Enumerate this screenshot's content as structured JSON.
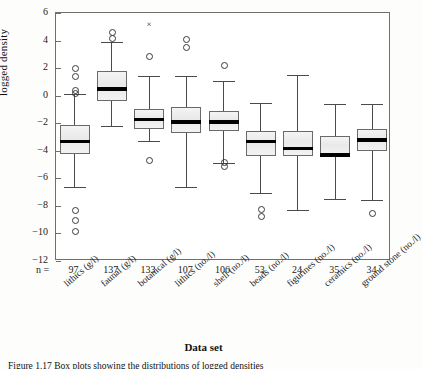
{
  "figure": {
    "caption_prefix": "Figure",
    "caption_text": "Figure  1.17 Box plots showing the distributions of logged densities"
  },
  "axes": {
    "ylabel": "logged density",
    "xlabel": "Data set",
    "n_prefix": "n =",
    "yticks": [
      6,
      4,
      2,
      0,
      -2,
      -4,
      -6,
      -8,
      -10,
      -12
    ],
    "ytick_labels": [
      "6",
      "4",
      "2",
      "0",
      "−2",
      "−4",
      "−6",
      "−8",
      "−10",
      "−12"
    ],
    "ylim": [
      -12,
      6
    ],
    "grid": false
  },
  "chart_data": {
    "type": "box",
    "title": "",
    "xlabel": "Data set",
    "ylabel": "logged density",
    "ylim": [
      -12,
      6
    ],
    "grid": false,
    "legend": "none",
    "categories": [
      "lithics (g/l)",
      "faunal (g/l)",
      "botanical (g/l)",
      "lithics (no./l)",
      "shell (no./l)",
      "beads (no./l)",
      "figurines (no./l)",
      "ceramics (no./l)",
      "ground stone (no./l)"
    ],
    "n": [
      97,
      137,
      133,
      107,
      106,
      53,
      24,
      35,
      34
    ],
    "boxes": [
      {
        "category": "lithics (g/l)",
        "n": 97,
        "whisker_low": -6.6,
        "q1": -4.2,
        "median": -3.3,
        "q3": -2.1,
        "whisker_high": 0.1,
        "outliers": [
          2.0,
          1.4,
          0.4,
          0.2,
          -8.3,
          -9.0,
          -9.8
        ],
        "extreme_outliers": []
      },
      {
        "category": "faunal (g/l)",
        "n": 137,
        "whisker_low": -2.2,
        "q1": -0.4,
        "median": 0.5,
        "q3": 1.8,
        "whisker_high": 3.9,
        "outliers": [
          4.6,
          4.2
        ],
        "extreme_outliers": []
      },
      {
        "category": "botanical (g/l)",
        "n": 133,
        "whisker_low": -3.3,
        "q1": -2.4,
        "median": -1.7,
        "q3": -1.0,
        "whisker_high": 1.4,
        "outliers": [
          2.9,
          -4.7
        ],
        "extreme_outliers": [
          5.2
        ]
      },
      {
        "category": "lithics (no./l)",
        "n": 107,
        "whisker_low": -6.6,
        "q1": -2.7,
        "median": -1.9,
        "q3": -0.8,
        "whisker_high": 1.4,
        "outliers": [
          4.1,
          3.5
        ],
        "extreme_outliers": []
      },
      {
        "category": "shell (no./l)",
        "n": 106,
        "whisker_low": -4.9,
        "q1": -2.6,
        "median": -1.9,
        "q3": -1.1,
        "whisker_high": 1.1,
        "outliers": [
          2.2,
          -4.8,
          -5.1
        ],
        "extreme_outliers": []
      },
      {
        "category": "beads (no./l)",
        "n": 53,
        "whisker_low": -7.1,
        "q1": -4.4,
        "median": -3.3,
        "q3": -2.6,
        "whisker_high": -0.5,
        "outliers": [
          -8.2,
          -8.7
        ],
        "extreme_outliers": []
      },
      {
        "category": "figurines (no./l)",
        "n": 24,
        "whisker_low": -8.3,
        "q1": -4.4,
        "median": -3.8,
        "q3": -2.6,
        "whisker_high": 1.5,
        "outliers": [],
        "extreme_outliers": []
      },
      {
        "category": "ceramics (no./l)",
        "n": 35,
        "whisker_low": -7.5,
        "q1": -4.4,
        "median": -4.3,
        "q3": -2.9,
        "whisker_high": -0.6,
        "outliers": [],
        "extreme_outliers": []
      },
      {
        "category": "ground stone (no./l)",
        "n": 34,
        "whisker_low": -7.6,
        "q1": -4.0,
        "median": -3.2,
        "q3": -2.4,
        "whisker_high": -0.6,
        "outliers": [
          -8.5
        ],
        "extreme_outliers": []
      }
    ]
  }
}
